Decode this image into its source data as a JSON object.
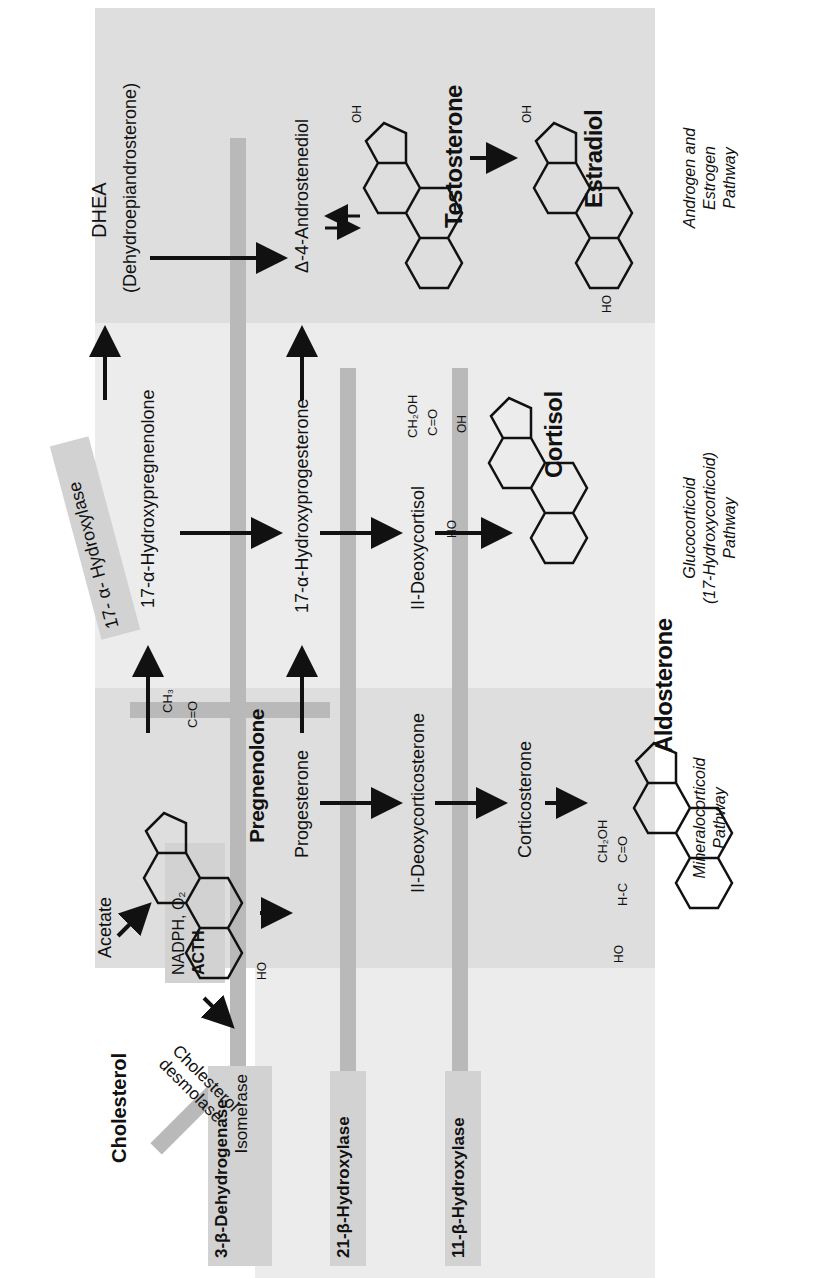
{
  "diagram": {
    "orientation": "rotated-90-ccw",
    "colors": {
      "panel": "#ececec",
      "panel_dark": "#dedede",
      "enzyme_bar": "#b9b9b9",
      "enzyme_box": "#d2d2d2",
      "ink": "#111111"
    },
    "precursors": {
      "acetate": "Acetate",
      "cholesterol": "Cholesterol",
      "cofactors_line1": "NADPH, O₂",
      "cofactors_line2": "ACTH",
      "desmolase_line1": "Cholesterol",
      "desmolase_line2": "desmolase"
    },
    "enzymes": {
      "e3b_line1": "3-β-Dehydrogenase",
      "e3b_line2": "Isomerase",
      "e21": "21-β-Hydroxylase",
      "e11": "11-β-Hydroxylase",
      "e17": "17- α- Hydroxylase"
    },
    "compounds": {
      "pregnenolone": "Pregnenolone",
      "hydroxypregnenolone": "17-α-Hydroxypregnenolone",
      "dhea": "DHEA",
      "dhea_full": "(Dehydroepiandrosterone)",
      "progesterone": "Progesterone",
      "hydroxyprogesterone": "17-α-Hydroxyprogesterone",
      "androstenediol": "Δ-4-Androstenediol",
      "deoxycorticosterone": "II-Deoxycorticosterone",
      "deoxycortisol": "II-Deoxycortisol",
      "corticosterone": "Corticosterone",
      "aldosterone": "Aldosterone",
      "cortisol": "Cortisol",
      "testosterone": "Testosterone",
      "estradiol": "Estradiol"
    },
    "groups": {
      "pregnenolone_ch3": "CH₃",
      "pregnenolone_co": "C=O",
      "pregnenolone_ho": "HO",
      "aldo_ch2oh": "CH₂OH",
      "aldo_co": "C=O",
      "aldo_hc": "H-C",
      "aldo_o": "O",
      "aldo_ho": "HO",
      "cortisol_ch2oh": "CH₂OH",
      "cortisol_co": "C=O",
      "cortisol_oh": "OH",
      "cortisol_ho": "HO",
      "testo_oh": "OH",
      "estra_oh": "OH",
      "estra_ho": "HO",
      "keto_o": "O"
    },
    "pathways": {
      "mineralocorticoid_line1": "Mineralocorticoid",
      "mineralocorticoid_line2": "Pathway",
      "glucocorticoid_line1": "Glucocorticoid",
      "glucocorticoid_line2": "(17-Hydroxycorticoid)",
      "glucocorticoid_line3": "Pathway",
      "androgen_line1": "Androgen and",
      "androgen_line2": "Estrogen",
      "androgen_line3": "Pathway"
    }
  }
}
